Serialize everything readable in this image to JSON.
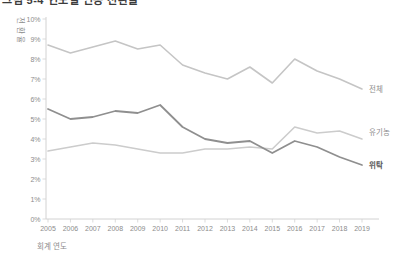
{
  "title": {
    "clipped_text": "그림 5-4 연도별 인증 전환율"
  },
  "chart_data": {
    "type": "line",
    "title": "",
    "xlabel": "회계 연도",
    "ylabel": "전환율",
    "x": [
      "2005",
      "2006",
      "2007",
      "2008",
      "2009",
      "2010",
      "2011",
      "2012",
      "2013",
      "2014",
      "2015",
      "2016",
      "2017",
      "2018",
      "2019"
    ],
    "ylim": [
      0,
      10
    ],
    "yticks": [
      "0%",
      "1%",
      "2%",
      "3%",
      "4%",
      "5%",
      "6%",
      "7%",
      "8%",
      "9%",
      "10%"
    ],
    "grid": false,
    "legend_position": "right-end-labels",
    "series": [
      {
        "name": "전체",
        "color": "#c5c5c5",
        "label_color": "#8c8c8c",
        "bold": false,
        "values": [
          8.7,
          8.3,
          8.6,
          8.9,
          8.5,
          8.7,
          7.7,
          7.3,
          7.0,
          7.6,
          6.8,
          8.0,
          7.4,
          7.0,
          6.5
        ]
      },
      {
        "name": "유기농",
        "color": "#cccccc",
        "label_color": "#8c8c8c",
        "bold": false,
        "values": [
          3.4,
          3.6,
          3.8,
          3.7,
          3.5,
          3.3,
          3.3,
          3.5,
          3.5,
          3.6,
          3.5,
          4.6,
          4.3,
          4.4,
          4.0
        ]
      },
      {
        "name": "위탁",
        "color": "#8f8f8f",
        "label_color": "#565656",
        "bold": true,
        "values": [
          5.5,
          5.0,
          5.1,
          5.4,
          5.3,
          5.7,
          4.6,
          4.0,
          3.8,
          3.9,
          3.3,
          3.9,
          3.6,
          3.1,
          2.7
        ]
      }
    ],
    "axis_color": "#d2d2d2",
    "text_color": "#8c8c8c"
  }
}
